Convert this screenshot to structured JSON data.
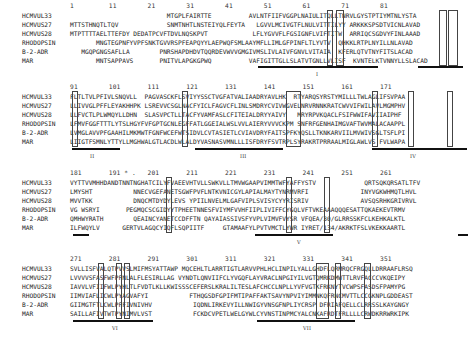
{
  "figure": {
    "blocks": [
      {
        "ruler": "1         11        21        31        41        51        61        71        81",
        "rows": [
          {
            "name": "HCMVUL33",
            "seq": "                          MTGPLFAIRTTE          AVLNTFIIFVGGPLNAIULITQLLTNRVLGYSTPTIYMTNLYSTA"
          },
          {
            "name": "HCMVUS27",
            "seq": "MTTSTHNQTLTQV             SNMTNHTLNSTEIYQLFEYTA   LGVVLMCIVGTFLNULVITTILYY ARKKKSPSDTVICNLAVAD"
          },
          {
            "name": "HCMVUS28",
            "seq": "MTPTTTTAELTTEFDY DEDATPCVFTDVLNQSKPVT            LFLYGVVFLFGSIGNFLVIFTITW  ARRIQCSGDVYFINLAAAD"
          },
          {
            "name": "RHODOPSIN",
            "seq": "       MNGTEGPNFYVPFSNKTGVVRSPFEAPQYYLAEPWQFSMLAAYMFLLIMLGFPINFLTLYVTV  QHKKLRTPLNYILLNLAVAD"
          },
          {
            "name": "B-2-ADR",
            "seq": "   MGQPGNGSAFLLA        PNRSHAPDHDVTQQRDEVWVVGMGIVMSLIVLAIVFGNVLVITAIA  KFERLQTVTNYFITSLACAD"
          },
          {
            "name": "MAR",
            "seq": "       MNTSAPPAVS       PNITVLAPGKGPWQ          VAFIGITTGLLSLATVTGNLLVLISF  KVNTELKTVNNYLLSLACAD"
          }
        ],
        "domains": [
          "I"
        ]
      },
      {
        "ruler": "91        101       111       121       131       141       151       161       171",
        "rows": [
          {
            "name": "HCMVUL33",
            "seq": "FLTLTVLPFIVLSNQVLL  PAGVASCKFLSVIYYSSCTVGFATVALIAADRYAVLHK  RTYARQSYRSTYMILLLTWLAGLIFSVPAA"
          },
          {
            "name": "HCMVUS27",
            "seq": "LLIVVGLPFFLEYAKHHPK LSREVVCSGLNACFYICLFAGVCFLINLSMDRYCVIVWGVELNRVRNNKRATCWVVIFWILAVLMGMPHV"
          },
          {
            "name": "HCMVUS28",
            "seq": "LLFVCTLPLWMQYLLDHN  SLASVPCTLLTACFYVAMFASLCFITEIALDRYYAIVY   MRYRPVKQACLFSIFWWIFAVIIAIPHF"
          },
          {
            "name": "RHODOPSIN",
            "seq": "LFMVFGGFTTTLYTSLHGYFVFGPTGCNLEGFFATLGGEIALWSLVVLAIERYVVVCKPM SNFRFGENHAIMGVAFTWVMALACAAPPL"
          },
          {
            "name": "B-2-ADR",
            "seq": "LVMGLAVVPFGAAHILMKMWTFGNFWCEFWTSIDVLCVTASIETLCVIAVDRYFAITSPFKYQSLLTKNKARVIILMVWIVSGLTSFLPI"
          },
          {
            "name": "MAR",
            "seq": "LIIGTFSMNLYTTYLLMGHWALGTLACDLWLALDYVASNASVMNLLLISFDRYFSVTRPLSYRAKRTPRRAALMIGLAWLVS FVLWAPA"
          }
        ],
        "domains": [
          "II",
          "III",
          "IV"
        ]
      },
      {
        "ruler": "181       191 * .   201       211       221       231       241       251       261",
        "rows": [
          {
            "name": "HCMVUL33",
            "seq": "VYTTVVMHHDANDTNNTNGHATCILYFVAEEVHTVLLSWKVLLTMVWGAAPVIMMTWFYAFFYSTV             QRTSQKQRSATLTFV"
          },
          {
            "name": "HCMVUS27",
            "seq": "LMYSHT           NNECVGEFANETSGWFPVFLNTKVNICGYLAPIALMAYTYNRMVRFI              INYVGKWHMQTLHVL"
          },
          {
            "name": "HCMVUS28",
            "seq": "MVVTKK           DNQCMTDYDYLEVS YPIILNVELMLGAFVIPLSVISYCYYRISRIV              AVSQSRHKGRIVRVL"
          },
          {
            "name": "RHODOPSIN",
            "seq": "VG WSRYI       PEGMQCSCGIDYYTPHEETNNESFVIYMFVVHFIIPLIVIFFCYGQLVFTVKEAAAQQQESATTQKAEKEVTRMV"
          },
          {
            "name": "B-2-ADR",
            "seq": "QMHWYRATH        QEAINCYANETCCDFFTN QAYAIASSIVSFYVPLVIMVFVYSR VFQEA/30/GLRRSSKFCLKEHKALKTL"
          },
          {
            "name": "MAR",
            "seq": "ILFWQYLV      GERTVLAGQCYIQFLSQPIITF     GTAMAAFYLPVTVMCTLYWR IYRET/134/AKRKTFSLVKEKKAARTL"
          }
        ],
        "domains": [
          "V"
        ]
      },
      {
        "ruler": "271       281       291       301       311       321       331       341       351",
        "rows": [
          {
            "name": "HCMVUL33",
            "seq": "SVLLISFVALQTPVVSLMIFMSYATTAWP MQCEHLTLARRTIGTLARVVPHLHCLINPILYALLGHDFLQRMRQCFRGQLLDRRAAFLRSQ"
          },
          {
            "name": "HCMVUS27",
            "seq": "LVVVVSFASFWFPFNLALFLESIRLLAG VYNDTLQNVIIFCLYVGQFLAYVRACLNPGIYILVGTQMRKDMWTTLRVFACCCVKQEIPY"
          },
          {
            "name": "HCMVUS28",
            "seq": "IAVVLVFIIFWLPYHLTLFVDTLKLLKWISSSCEFERSLKRALILTESLAFCHCCLNPLLYVFVGTKFRKNYTVCWPSFASDSFPAMYPG"
          },
          {
            "name": "RHODOPSIN",
            "seq": "IIMVIAFLICWLPYAGVAFYI           FTHQGSDFGPIFMTIPAFFAKTSAVYNPVIYIMMNKQFRNCMVTTLCCGKNPLGDDEAST"
          },
          {
            "name": "B-2-ADR",
            "seq": "GIIMGTFTLCWLPFFIVNIVHV           IQDNLIRKEVYILLNWIGYVNSGFNPLIYCRSP DFRIAFQELLCLRRSSLKAYGNGY"
          },
          {
            "name": "MAR",
            "seq": "SAILLAFIVTWTPYNIMVLVST           FCKDCVPETLWELGYWLCYVNSTINPMCYALCNKAFRDTFRLLLLCRWDKRRWRKIPK"
          }
        ],
        "domains": [
          "VI",
          "VII"
        ]
      }
    ],
    "markers": {
      "asterisk": "*",
      "dot": "."
    }
  }
}
